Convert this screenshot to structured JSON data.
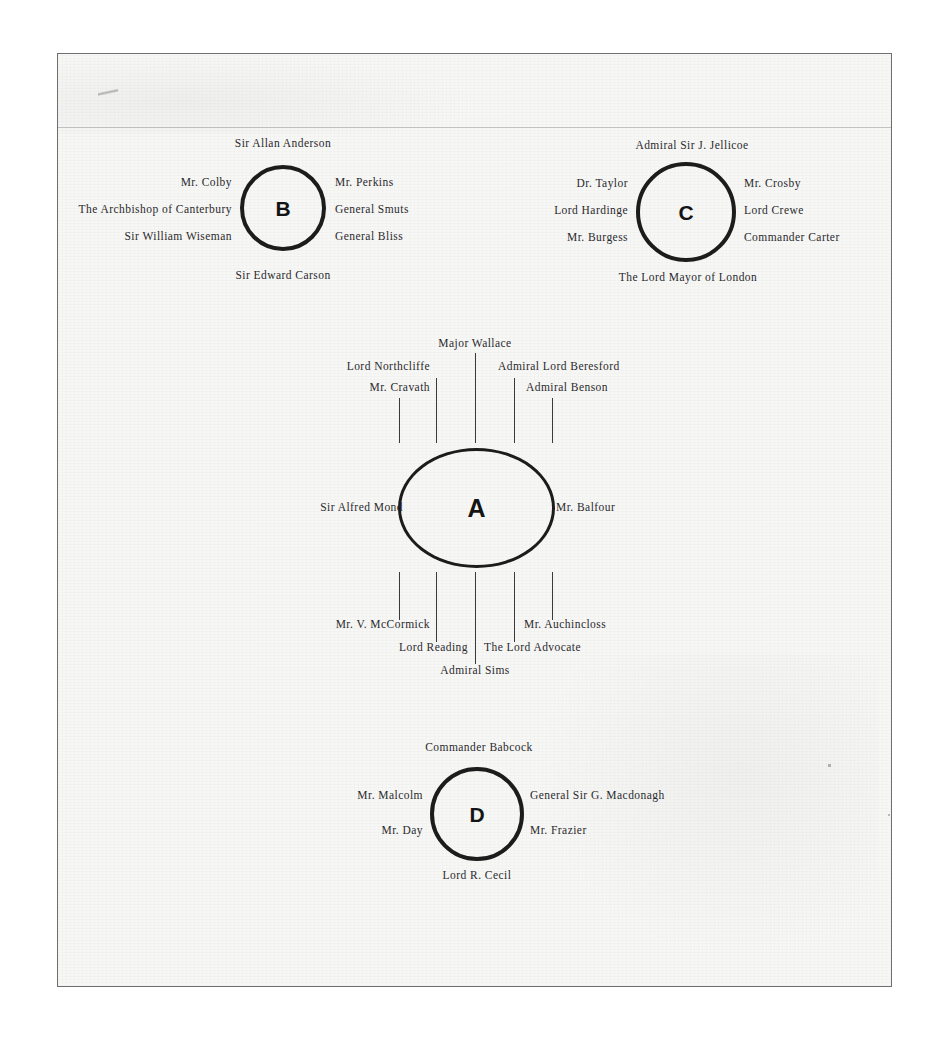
{
  "document": {
    "kind": "scanned-diagram-page",
    "background_color": "#f7f7f6",
    "ink_color": "#1c1c1c"
  },
  "diagram": {
    "type": "node-circles-with-radiating-name-labels",
    "nodes": [
      {
        "id": "B",
        "letter": "B",
        "shape": "circle",
        "center": [
          283,
          208
        ],
        "size": [
          86,
          86
        ],
        "labels": {
          "top": [
            "Sir Allan Anderson"
          ],
          "left": [
            "Mr. Colby",
            "The Archbishop of Canterbury",
            "Sir William Wiseman"
          ],
          "right": [
            "Mr. Perkins",
            "General Smuts",
            "General Bliss"
          ],
          "bottom": [
            "Sir Edward Carson"
          ]
        }
      },
      {
        "id": "C",
        "letter": "C",
        "shape": "circle",
        "center": [
          686,
          212
        ],
        "size": [
          100,
          100
        ],
        "labels": {
          "top": [
            "Admiral Sir J. Jellicoe"
          ],
          "left": [
            "Dr. Taylor",
            "Lord Hardinge",
            "Mr. Burgess"
          ],
          "right": [
            "Mr. Crosby",
            "Lord Crewe",
            "Commander Carter"
          ],
          "bottom": [
            "The Lord Mayor of London"
          ]
        }
      },
      {
        "id": "A",
        "letter": "A",
        "shape": "ellipse",
        "center": [
          476,
          508
        ],
        "size": [
          157,
          120
        ],
        "labels": {
          "top": [
            "Mr. Cravath",
            "Lord Northcliffe",
            "Major Wallace",
            "Admiral Lord Beresford",
            "Admiral Benson"
          ],
          "left": [
            "Sir Alfred Mond"
          ],
          "right": [
            "Mr. Balfour"
          ],
          "bottom": [
            "Mr. V. McCormick",
            "Lord Reading",
            "Admiral Sims",
            "The Lord Advocate",
            "Mr. Auchincloss"
          ]
        }
      },
      {
        "id": "D",
        "letter": "D",
        "shape": "circle",
        "center": [
          477,
          813
        ],
        "size": [
          94,
          94
        ],
        "labels": {
          "top": [
            "Commander Babcock"
          ],
          "left": [
            "Mr. Malcolm",
            "Mr. Day"
          ],
          "right": [
            "General Sir G. Macdonagh",
            "Mr. Frazier"
          ],
          "bottom": [
            "Lord R. Cecil"
          ]
        }
      }
    ],
    "labels_flat": {
      "b_top": "Sir Allan Anderson",
      "b_left_1": "Mr. Colby",
      "b_left_2": "The Archbishop of Canterbury",
      "b_left_3": "Sir William Wiseman",
      "b_right_1": "Mr. Perkins",
      "b_right_2": "General Smuts",
      "b_right_3": "General Bliss",
      "b_bottom": "Sir Edward Carson",
      "c_top": "Admiral Sir J. Jellicoe",
      "c_left_1": "Dr. Taylor",
      "c_left_2": "Lord Hardinge",
      "c_left_3": "Mr. Burgess",
      "c_right_1": "Mr. Crosby",
      "c_right_2": "Lord Crewe",
      "c_right_3": "Commander Carter",
      "c_bottom": "The Lord Mayor of London",
      "a_top_1": "Mr. Cravath",
      "a_top_2": "Lord Northcliffe",
      "a_top_3": "Major Wallace",
      "a_top_4": "Admiral Lord Beresford",
      "a_top_5": "Admiral Benson",
      "a_left": "Sir Alfred Mond",
      "a_right": "Mr. Balfour",
      "a_bottom_1": "Mr. V. McCormick",
      "a_bottom_2": "Lord Reading",
      "a_bottom_3": "Admiral Sims",
      "a_bottom_4": "The Lord Advocate",
      "a_bottom_5": "Mr. Auchincloss",
      "d_top": "Commander Babcock",
      "d_left_1": "Mr. Malcolm",
      "d_left_2": "Mr. Day",
      "d_right_1": "General Sir G. Macdonagh",
      "d_right_2": "Mr. Frazier",
      "d_bottom": "Lord R. Cecil"
    },
    "node_letters": {
      "a": "A",
      "b": "B",
      "c": "C",
      "d": "D"
    }
  }
}
